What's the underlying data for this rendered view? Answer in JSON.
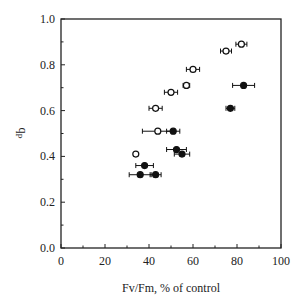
{
  "chart_data": {
    "type": "scatter",
    "title": "",
    "xlabel": "Fv/Fm, % of control",
    "ylabel": "qP",
    "ylabel_main": "q",
    "ylabel_sub": "P",
    "xlim": [
      0,
      100
    ],
    "ylim": [
      0.0,
      1.0
    ],
    "x_ticks": [
      0,
      20,
      40,
      60,
      80,
      100
    ],
    "x_tick_labels": [
      "0",
      "20",
      "40",
      "60",
      "80",
      "100"
    ],
    "y_ticks": [
      0.0,
      0.2,
      0.4,
      0.6,
      0.8,
      1.0
    ],
    "y_tick_labels": [
      "0.0",
      "0.2",
      "0.4",
      "0.6",
      "0.8",
      "1.0"
    ],
    "grid": false,
    "legend": null,
    "series": [
      {
        "name": "open circles",
        "marker": "open-circle",
        "points": [
          {
            "x": 82,
            "y": 0.89,
            "xerr": 2.5
          },
          {
            "x": 75,
            "y": 0.86,
            "xerr": 2.5
          },
          {
            "x": 60,
            "y": 0.78,
            "xerr": 3
          },
          {
            "x": 57,
            "y": 0.71,
            "xerr": 1.5
          },
          {
            "x": 50,
            "y": 0.68,
            "xerr": 3
          },
          {
            "x": 43,
            "y": 0.61,
            "xerr": 3
          },
          {
            "x": 44,
            "y": 0.51,
            "xerr": 7
          },
          {
            "x": 34,
            "y": 0.41,
            "xerr": 0
          }
        ]
      },
      {
        "name": "filled circles",
        "marker": "filled-circle",
        "points": [
          {
            "x": 83,
            "y": 0.71,
            "xerr": 5
          },
          {
            "x": 77,
            "y": 0.61,
            "xerr": 2
          },
          {
            "x": 51,
            "y": 0.51,
            "xerr": 3
          },
          {
            "x": 52.5,
            "y": 0.43,
            "xerr": 4.5
          },
          {
            "x": 55,
            "y": 0.41,
            "xerr": 3.5
          },
          {
            "x": 38,
            "y": 0.36,
            "xerr": 4
          },
          {
            "x": 36,
            "y": 0.32,
            "xerr": 5
          },
          {
            "x": 43,
            "y": 0.32,
            "xerr": 2.5
          }
        ]
      }
    ]
  },
  "colors": {
    "axis": "#222222",
    "marker": "#111111",
    "background": "#ffffff"
  }
}
